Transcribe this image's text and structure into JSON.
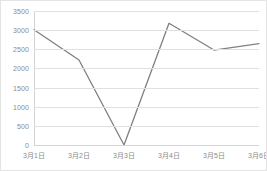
{
  "chart_data": {
    "type": "line",
    "title": "",
    "subtitle": "",
    "xlabel": "",
    "ylabel": "",
    "categories": [
      "3月1日",
      "3月2日",
      "3月3日",
      "3月4日",
      "3月5日",
      "3月6日"
    ],
    "series": [
      {
        "name": "",
        "values": [
          3010,
          2220,
          0,
          3180,
          2480,
          2650
        ]
      }
    ],
    "ylim": [
      0,
      3500
    ],
    "yticks": [
      0,
      500,
      1000,
      1500,
      2000,
      2500,
      3000,
      3500
    ],
    "ytick_labels": [
      "0",
      "500",
      "1000",
      "1500",
      "2000",
      "2500",
      "3000",
      "3500"
    ],
    "grid": true,
    "legend": false,
    "legend_position": "none",
    "colors": {
      "series_line": "#808080",
      "gridline": "#e0e0e0",
      "axis": "#d4d4d4",
      "tick_text": "#8a8a8a",
      "plot_background": "#ffffff",
      "border": "#e4e4e4"
    },
    "line_width": 1.3,
    "markers": false
  }
}
